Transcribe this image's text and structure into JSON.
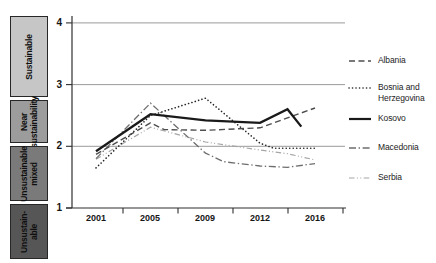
{
  "page": {
    "width": 436,
    "height": 263,
    "background": "#ffffff"
  },
  "category_boxes": [
    {
      "line1": "Sustainable",
      "line2": "",
      "bg": "#c6c6c6"
    },
    {
      "line1": "Near",
      "line2": "sustainability",
      "bg": "#9c9c9c"
    },
    {
      "line1": "Unsustainable",
      "line2": "mixed",
      "bg": "#7a7a7a"
    },
    {
      "line1": "Unsustain-",
      "line2": "able",
      "bg": "#565656"
    }
  ],
  "axes": {
    "y_ticks": [
      "4",
      "3",
      "2",
      "1"
    ],
    "x_ticks": [
      "2001",
      "2005",
      "2009",
      "2012",
      "2016"
    ]
  },
  "colors": {
    "gridline": "#8f8f8f",
    "axis": "#2f2f2f",
    "text": "#161616"
  },
  "chart_data": {
    "type": "line",
    "title": "",
    "xlabel": "",
    "ylabel": "",
    "x_tick_years": [
      2001,
      2005,
      2009,
      2012,
      2016
    ],
    "ylim": [
      1,
      4
    ],
    "grid": "horizontal",
    "legend_position": "right",
    "y_category_bands": [
      {
        "range": [
          3,
          4
        ],
        "label": "Sustainable"
      },
      {
        "range": [
          2,
          3
        ],
        "label": "Near sustainability"
      },
      {
        "range": [
          1,
          2
        ],
        "label": "Unsustainable mixed"
      },
      {
        "range": [
          0,
          1
        ],
        "label": "Unsustainable"
      }
    ],
    "series": [
      {
        "name": "Albania",
        "dash": "dashed",
        "color": "#4d4d4d",
        "width": 1.4,
        "points": [
          [
            2001,
            1.87
          ],
          [
            2005,
            2.38
          ],
          [
            2006,
            2.27
          ],
          [
            2009,
            2.26
          ],
          [
            2012,
            2.3
          ],
          [
            2016,
            2.62
          ]
        ]
      },
      {
        "name": "Bosnia and Herzegovina",
        "dash": "dotted",
        "color": "#262626",
        "width": 1.6,
        "points": [
          [
            2001,
            1.65
          ],
          [
            2005,
            2.5
          ],
          [
            2009,
            2.78
          ],
          [
            2012,
            2.05
          ],
          [
            2013,
            1.97
          ],
          [
            2016,
            1.97
          ]
        ]
      },
      {
        "name": "Kosovo",
        "dash": "solid",
        "color": "#1a1a1a",
        "width": 2.3,
        "points": [
          [
            2001,
            1.92
          ],
          [
            2005,
            2.52
          ],
          [
            2009,
            2.42
          ],
          [
            2012,
            2.38
          ],
          [
            2014,
            2.6
          ],
          [
            2015,
            2.32
          ]
        ]
      },
      {
        "name": "Macedonia",
        "dash": "dashdot",
        "color": "#6e6e6e",
        "width": 1.3,
        "points": [
          [
            2001,
            1.8
          ],
          [
            2005,
            2.7
          ],
          [
            2009,
            1.89
          ],
          [
            2010,
            1.75
          ],
          [
            2012,
            1.68
          ],
          [
            2014,
            1.66
          ],
          [
            2016,
            1.72
          ]
        ]
      },
      {
        "name": "Serbia",
        "dash": "dashdotdot",
        "color": "#a5a5a5",
        "width": 1.2,
        "points": [
          [
            2001,
            1.79
          ],
          [
            2005,
            2.31
          ],
          [
            2009,
            2.07
          ],
          [
            2012,
            1.94
          ],
          [
            2014,
            1.88
          ],
          [
            2016,
            1.78
          ]
        ]
      }
    ]
  }
}
